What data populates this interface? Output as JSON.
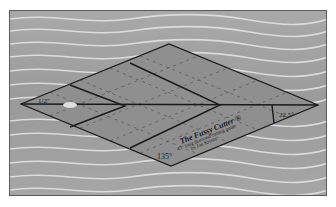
{
  "photo": {
    "subject": "diamond-shaped quilting ruler on wavy fabric",
    "ruler": {
      "title": "The Fussy Cutter ®",
      "subtitle": "45° long diamond cutting guide",
      "author": "by Jan Krentz",
      "angle_obtuse": "135°",
      "angle_acute": "22.5°",
      "left_tip_label": "1/2\"",
      "line_labels": [
        "1",
        "2",
        "3",
        "4"
      ]
    },
    "colors": {
      "background": "#a3a3a3",
      "ruler": "#8f8f8f",
      "lines": "#1a1a1a",
      "highlights": "#e8e8e8"
    }
  }
}
